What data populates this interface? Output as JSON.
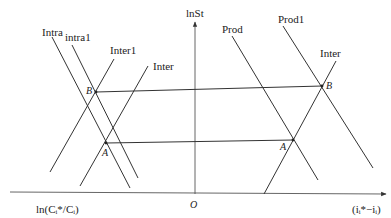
{
  "axes": {
    "y_label": "lnSt",
    "x_left_label": "ln(Cᵢ*/Cᵢ)",
    "x_right_label": "(iᵢ*−iᵢ)",
    "origin_label": "O"
  },
  "curves": {
    "intra": "Intra",
    "intra1": "intra1",
    "inter1": "Inter1",
    "inter_left": "Inter",
    "prod": "Prod",
    "prod1": "Prod1",
    "inter_right": "Inter"
  },
  "points": {
    "b_left": "B",
    "a_left": "A",
    "b_right": "B",
    "a_right": "A"
  },
  "colors": {
    "line": "#333333",
    "background": "#ffffff"
  }
}
